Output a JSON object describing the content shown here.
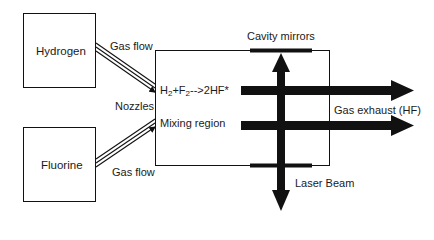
{
  "diagram": {
    "sources": [
      {
        "id": "hydrogen",
        "label": "Hydrogen"
      },
      {
        "id": "fluorine",
        "label": "Fluorine"
      }
    ],
    "flows": [
      {
        "label": "Gas flow",
        "from": "hydrogen"
      },
      {
        "label": "Gas flow",
        "from": "fluorine"
      }
    ],
    "chamber": {
      "nozzles_label": "Nozzles",
      "reaction": {
        "h": "H",
        "h_sub": "2",
        "plus": "+F",
        "f_sub": "2",
        "rest": "-->2HF*"
      },
      "mixing_label": "Mixing region",
      "mirrors_label": "Cavity mirrors"
    },
    "outputs": {
      "exhaust_label": "Gas exhaust (HF)",
      "laser_label": "Laser Beam"
    },
    "colors": {
      "line": "#111111",
      "background": "#ffffff"
    }
  }
}
